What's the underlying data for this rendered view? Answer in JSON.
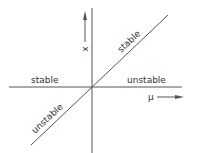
{
  "diagram": {
    "type": "transcritical bifurcation",
    "axes": {
      "horizontal_label": "μ",
      "vertical_label": "x"
    },
    "branches": {
      "horizontal_left": "stable",
      "horizontal_right": "unstable",
      "diagonal_upper": "stable",
      "diagonal_lower": "unstable"
    },
    "colors": {
      "line": "#555555",
      "text": "#333333",
      "background": "#ffffff"
    }
  }
}
